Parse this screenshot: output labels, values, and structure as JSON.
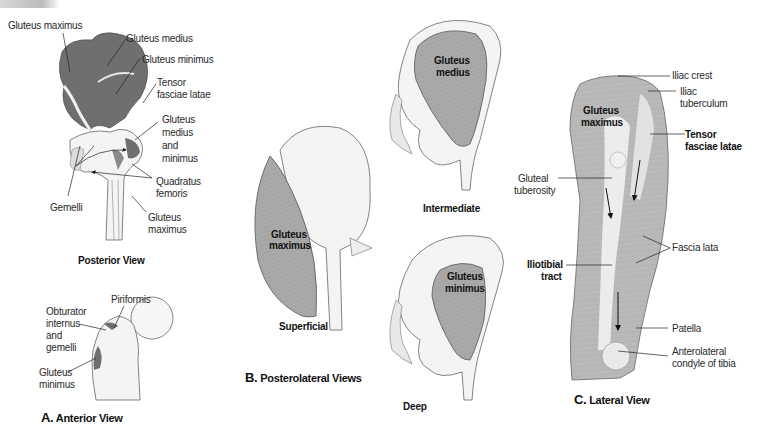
{
  "figure": {
    "panels": [
      {
        "id": "A",
        "letter": "A.",
        "title": "Anterior View",
        "sub_views": [
          {
            "caption": "Posterior View",
            "labels": [
              "Gluteus maximus",
              "Gluteus medius",
              "Gluteus minimus",
              "Tensor",
              "fasciae latae",
              "Gluteus",
              "medius",
              "and",
              "minimus",
              "Quadratus",
              "femoris",
              "Gemelli",
              "Gluteus",
              "maximus"
            ]
          },
          {
            "caption": "",
            "labels": [
              "Piriformis",
              "Obturator",
              "internus",
              "and",
              "gemelli",
              "Gluteus",
              "minimus"
            ]
          }
        ]
      },
      {
        "id": "B",
        "letter": "B.",
        "title": "Posterolateral Views",
        "sub_views": [
          {
            "caption": "Superficial",
            "labels": [
              "Gluteus",
              "maximus"
            ]
          },
          {
            "caption": "Intermediate",
            "labels": [
              "Gluteus",
              "medius"
            ]
          },
          {
            "caption": "Deep",
            "labels": [
              "Gluteus",
              "minimus"
            ]
          }
        ]
      },
      {
        "id": "C",
        "letter": "C.",
        "title": "Lateral View",
        "labels": [
          "Iliac crest",
          "Iliac",
          "tuberculum",
          "Gluteus",
          "maximus",
          "Tensor",
          "fasciae latae",
          "Gluteal",
          "tuberosity",
          "Fascia lata",
          "Iliotibial",
          "tract",
          "Patella",
          "Anterolateral",
          "condyle of tibia"
        ]
      }
    ]
  },
  "colors": {
    "muscle_attachment": "#6f6f6f",
    "muscle_fill": "#a9a9a9",
    "bone": "#f4f4f4",
    "outline": "#555555"
  }
}
